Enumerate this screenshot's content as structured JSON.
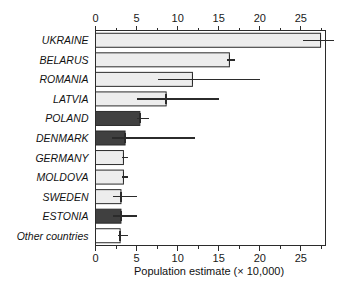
{
  "chart_data": {
    "type": "bar",
    "orientation": "horizontal",
    "title": "",
    "xlabel": "Population estimate (× 10,000)",
    "ylabel": "",
    "xlim": [
      0,
      28
    ],
    "xticks": [
      0,
      5,
      10,
      15,
      20,
      25
    ],
    "xtick_labels": [
      "0",
      "5",
      "10",
      "15",
      "20",
      "25"
    ],
    "minor_tick_step": 2.5,
    "grid": false,
    "legend": null,
    "axis_top": true,
    "axis_bottom": true,
    "categories": [
      "UKRAINE",
      "BELARUS",
      "ROMANIA",
      "LATVIA",
      "POLAND",
      "DENMARK",
      "GERMANY",
      "MOLDOVA",
      "SWEDEN",
      "ESTONIA",
      "Other countries"
    ],
    "values": [
      27.4,
      16.3,
      11.8,
      8.6,
      5.4,
      3.6,
      3.4,
      3.4,
      3.1,
      3.1,
      3.0
    ],
    "error_low": [
      25.2,
      16.0,
      7.6,
      5.1,
      5.0,
      2.0,
      3.2,
      3.2,
      2.1,
      2.1,
      2.7
    ],
    "error_high": [
      29.0,
      17.0,
      20.0,
      15.0,
      6.5,
      12.1,
      4.0,
      4.0,
      5.0,
      5.0,
      3.9
    ],
    "fills": [
      "light",
      "light",
      "light",
      "light",
      "dark",
      "dark",
      "light",
      "light",
      "light",
      "dark",
      "white"
    ],
    "colors": {
      "light": "#ededed",
      "dark": "#404040",
      "white": "#ffffff",
      "outline": "#2b2b2b",
      "error": "#2b2b2b",
      "text": "#111111",
      "background": "#ffffff"
    }
  }
}
